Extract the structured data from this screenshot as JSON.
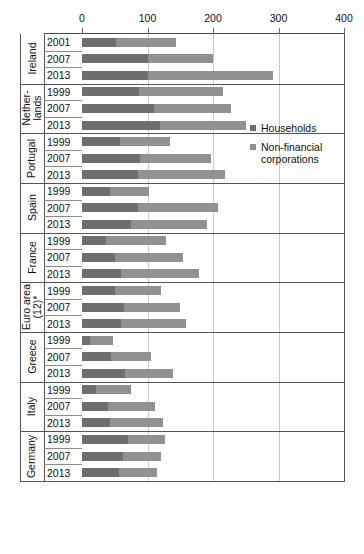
{
  "chart_data": {
    "type": "bar",
    "orientation": "horizontal",
    "stacked": true,
    "title": "",
    "subtitle": "",
    "xlabel": "",
    "ylabel": "",
    "xlim": [
      0,
      400
    ],
    "xticks": [
      0,
      100,
      200,
      300,
      400
    ],
    "xticklabels": [
      "0",
      "100",
      "200",
      "300",
      "400"
    ],
    "grid": true,
    "grid_axis": "x",
    "legend_position": "right",
    "series": [
      {
        "name": "Households",
        "color": "#6e6e6e"
      },
      {
        "name": "Non-financial corporations",
        "color": "#919191"
      }
    ],
    "groups": [
      {
        "country": "Ireland",
        "rows": [
          {
            "year": "2001",
            "households": 52,
            "non_financial_corporations": 91,
            "total": 143
          },
          {
            "year": "2007",
            "households": 100,
            "non_financial_corporations": 100,
            "total": 200
          },
          {
            "year": "2013",
            "households": 100,
            "non_financial_corporations": 192,
            "total": 292
          }
        ]
      },
      {
        "country": "Nether-lands",
        "rows": [
          {
            "year": "1999",
            "households": 87,
            "non_financial_corporations": 128,
            "total": 215
          },
          {
            "year": "2007",
            "households": 110,
            "non_financial_corporations": 117,
            "total": 227
          },
          {
            "year": "2013",
            "households": 119,
            "non_financial_corporations": 132,
            "total": 251
          }
        ]
      },
      {
        "country": "Portugal",
        "rows": [
          {
            "year": "1999",
            "households": 58,
            "non_financial_corporations": 76,
            "total": 134
          },
          {
            "year": "2007",
            "households": 89,
            "non_financial_corporations": 108,
            "total": 197
          },
          {
            "year": "2013",
            "households": 85,
            "non_financial_corporations": 133,
            "total": 218
          }
        ]
      },
      {
        "country": "Spain",
        "rows": [
          {
            "year": "1999",
            "households": 43,
            "non_financial_corporations": 60,
            "total": 103
          },
          {
            "year": "2007",
            "households": 85,
            "non_financial_corporations": 123,
            "total": 208
          },
          {
            "year": "2013",
            "households": 75,
            "non_financial_corporations": 116,
            "total": 191
          }
        ]
      },
      {
        "country": "France",
        "rows": [
          {
            "year": "1999",
            "households": 37,
            "non_financial_corporations": 91,
            "total": 128
          },
          {
            "year": "2007",
            "households": 50,
            "non_financial_corporations": 104,
            "total": 154
          },
          {
            "year": "2013",
            "households": 59,
            "non_financial_corporations": 119,
            "total": 178
          }
        ]
      },
      {
        "country": "Euro area (12)*",
        "rows": [
          {
            "year": "1999",
            "households": 50,
            "non_financial_corporations": 71,
            "total": 121
          },
          {
            "year": "2007",
            "households": 64,
            "non_financial_corporations": 85,
            "total": 149
          },
          {
            "year": "2013",
            "households": 60,
            "non_financial_corporations": 99,
            "total": 159
          }
        ]
      },
      {
        "country": "Greece",
        "rows": [
          {
            "year": "1999",
            "households": 12,
            "non_financial_corporations": 35,
            "total": 47
          },
          {
            "year": "2007",
            "households": 45,
            "non_financial_corporations": 60,
            "total": 105
          },
          {
            "year": "2013",
            "households": 66,
            "non_financial_corporations": 73,
            "total": 139
          }
        ]
      },
      {
        "country": "Italy",
        "rows": [
          {
            "year": "1999",
            "households": 22,
            "non_financial_corporations": 53,
            "total": 75
          },
          {
            "year": "2007",
            "households": 40,
            "non_financial_corporations": 72,
            "total": 112
          },
          {
            "year": "2013",
            "households": 43,
            "non_financial_corporations": 81,
            "total": 124
          }
        ]
      },
      {
        "country": "Germany",
        "rows": [
          {
            "year": "1999",
            "households": 70,
            "non_financial_corporations": 57,
            "total": 127
          },
          {
            "year": "2007",
            "households": 62,
            "non_financial_corporations": 59,
            "total": 121
          },
          {
            "year": "2013",
            "households": 57,
            "non_financial_corporations": 57,
            "total": 114
          }
        ]
      }
    ]
  },
  "legend": {
    "items": [
      {
        "label": "Households",
        "color": "#6e6e6e"
      },
      {
        "label": "Non-financial corporations",
        "color": "#919191"
      }
    ]
  },
  "colors": {
    "households": "#6e6e6e",
    "non_financial_corporations": "#919191",
    "axis": "#555555",
    "grid": "#c9c9c9",
    "background": "#ffffff"
  }
}
